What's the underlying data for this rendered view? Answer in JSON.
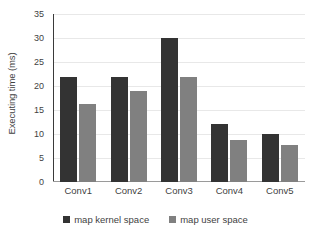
{
  "chart_data": {
    "type": "bar",
    "title": "",
    "xlabel": "",
    "ylabel": "Executing time (ms)",
    "categories": [
      "Conv1",
      "Conv2",
      "Conv3",
      "Conv4",
      "Conv5"
    ],
    "series": [
      {
        "name": "map kernel space",
        "color": "#333333",
        "values": [
          21.8,
          21.8,
          30.1,
          12.0,
          10.0
        ]
      },
      {
        "name": "map user space",
        "color": "#808080",
        "values": [
          16.3,
          18.9,
          21.8,
          8.8,
          7.8
        ]
      }
    ],
    "ylim": [
      0,
      35
    ],
    "yticks": [
      35,
      30,
      25,
      20,
      15,
      10,
      5,
      0
    ],
    "ytick_labels": [
      "35",
      "30",
      "25",
      "20",
      "15",
      "10",
      "5",
      "0"
    ],
    "grid": true,
    "grid_axis": "y",
    "legend_position": "bottom",
    "legend": [
      "map kernel space",
      "map user space"
    ]
  }
}
